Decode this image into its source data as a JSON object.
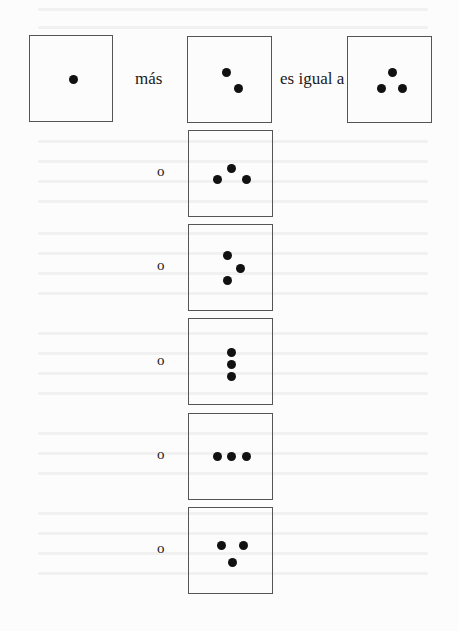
{
  "equation": {
    "terms": [
      {
        "id": "addend-1",
        "dot_count": 1,
        "pattern": "single-center"
      },
      {
        "id": "addend-2",
        "dot_count": 2,
        "pattern": "diagonal"
      },
      {
        "id": "sum",
        "dot_count": 3,
        "pattern": "triangle-up"
      }
    ],
    "plus_label": "más",
    "equals_label": "es igual a"
  },
  "alternatives": {
    "connector_label": "o",
    "items": [
      {
        "dot_count": 3,
        "pattern": "triangle-up"
      },
      {
        "dot_count": 3,
        "pattern": "triangle-right"
      },
      {
        "dot_count": 3,
        "pattern": "vertical-line"
      },
      {
        "dot_count": 3,
        "pattern": "horizontal-line"
      },
      {
        "dot_count": 3,
        "pattern": "triangle-down"
      }
    ]
  },
  "colors": {
    "dot": "#111111",
    "box_border": "#555555",
    "text": "#1a1a1a",
    "paper": "#fcfcfc"
  }
}
